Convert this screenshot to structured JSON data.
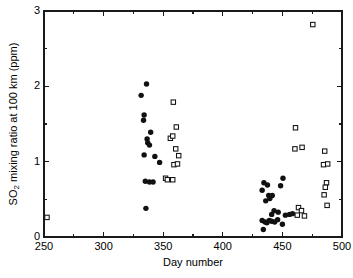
{
  "figure": {
    "name": "so2-mixing-ratio-scatter",
    "background": "#ffffff",
    "ink_color": "#111111"
  },
  "chart_data": {
    "type": "scatter",
    "title": "",
    "xlabel": "Day number",
    "ylabel": "SO2 mixing ratio at 100 km (ppm)",
    "ylabel_main": "SO",
    "ylabel_sub": "2",
    "ylabel_rest": " mixing ratio at 100 km (ppm)",
    "xlim": [
      250,
      500
    ],
    "ylim": [
      0,
      3
    ],
    "grid": false,
    "legend_position": "none",
    "xticks": [
      250,
      300,
      350,
      400,
      450,
      500
    ],
    "xtick_labels": [
      "250",
      "300",
      "350",
      "400",
      "450",
      "500"
    ],
    "xticks_minor": [
      275,
      325,
      375,
      425,
      475
    ],
    "yticks": [
      0,
      1,
      2,
      3
    ],
    "ytick_labels": [
      "0",
      "1",
      "2",
      "3"
    ],
    "yticks_minor": [
      0.5,
      1.5,
      2.5
    ],
    "series": [
      {
        "name": "filled-circles",
        "marker": "circle-filled",
        "color": "#111111",
        "points": [
          [
            331.5,
            1.88
          ],
          [
            336.0,
            2.03
          ],
          [
            334.0,
            1.62
          ],
          [
            333.5,
            1.55
          ],
          [
            339.5,
            1.39
          ],
          [
            336.5,
            1.3
          ],
          [
            337.0,
            1.25
          ],
          [
            338.5,
            1.22
          ],
          [
            334.0,
            1.09
          ],
          [
            343.0,
            1.07
          ],
          [
            347.0,
            0.99
          ],
          [
            335.0,
            0.74
          ],
          [
            338.5,
            0.73
          ],
          [
            341.5,
            0.73
          ],
          [
            335.5,
            0.38
          ],
          [
            434.5,
            0.72
          ],
          [
            437.5,
            0.69
          ],
          [
            450.5,
            0.78
          ],
          [
            448.5,
            0.68
          ],
          [
            433.0,
            0.62
          ],
          [
            438.5,
            0.55
          ],
          [
            441.5,
            0.55
          ],
          [
            439.5,
            0.51
          ],
          [
            436.0,
            0.48
          ],
          [
            443.0,
            0.35
          ],
          [
            446.5,
            0.33
          ],
          [
            441.0,
            0.3
          ],
          [
            452.5,
            0.29
          ],
          [
            456.0,
            0.3
          ],
          [
            458.5,
            0.31
          ],
          [
            433.0,
            0.22
          ],
          [
            435.5,
            0.2
          ],
          [
            437.0,
            0.19
          ],
          [
            439.0,
            0.22
          ],
          [
            441.0,
            0.21
          ],
          [
            443.5,
            0.2
          ],
          [
            446.0,
            0.23
          ],
          [
            450.0,
            0.17
          ],
          [
            434.0,
            0.1
          ]
        ]
      },
      {
        "name": "open-squares",
        "marker": "square-open",
        "color": "#111111",
        "points": [
          [
            252.5,
            0.26
          ],
          [
            358.5,
            1.79
          ],
          [
            361.0,
            1.46
          ],
          [
            356.0,
            1.31
          ],
          [
            358.0,
            1.34
          ],
          [
            360.5,
            1.17
          ],
          [
            363.0,
            1.08
          ],
          [
            359.0,
            0.96
          ],
          [
            362.0,
            0.97
          ],
          [
            352.0,
            0.78
          ],
          [
            353.5,
            0.76
          ],
          [
            358.0,
            0.76
          ],
          [
            461.0,
            1.45
          ],
          [
            460.5,
            1.17
          ],
          [
            466.5,
            1.19
          ],
          [
            475.5,
            2.82
          ],
          [
            485.5,
            1.14
          ],
          [
            484.5,
            0.96
          ],
          [
            488.0,
            0.97
          ],
          [
            487.0,
            0.72
          ],
          [
            486.0,
            0.66
          ],
          [
            485.0,
            0.56
          ],
          [
            487.5,
            0.42
          ],
          [
            463.5,
            0.39
          ],
          [
            466.0,
            0.35
          ],
          [
            462.5,
            0.29
          ],
          [
            468.5,
            0.28
          ]
        ]
      }
    ]
  },
  "geometry": {
    "plot_left_px": 44,
    "plot_right_px": 342,
    "plot_top_px": 11,
    "plot_bottom_px": 237
  }
}
